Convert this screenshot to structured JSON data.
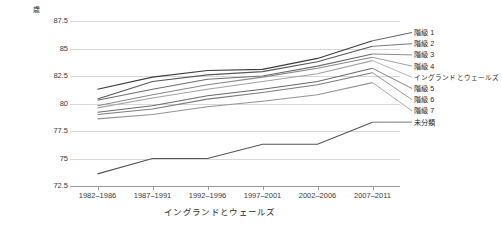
{
  "chart_data": {
    "type": "line",
    "title": "",
    "xlabel": "イングランドとウェールズ",
    "ylabel": "歳",
    "y_unit": "歳",
    "categories": [
      "1982–1986",
      "1987–1991",
      "1992–1996",
      "1997–2001",
      "2002–2006",
      "2007–2011"
    ],
    "ylim": [
      72.5,
      87.5
    ],
    "yticks": [
      "72.5",
      "75",
      "77.5",
      "80",
      "82.5",
      "85",
      "87.5"
    ],
    "grid": true,
    "legend_position": "right",
    "series": [
      {
        "name": "階級 1",
        "color": "#3c3c3c",
        "values": [
          81.3,
          82.4,
          83.0,
          83.1,
          84.1,
          85.7
        ]
      },
      {
        "name": "階級 2",
        "color": "#585858",
        "values": [
          80.4,
          82.0,
          82.6,
          82.9,
          83.8,
          85.2
        ]
      },
      {
        "name": "階級 3",
        "color": "#6e6e6e",
        "values": [
          80.3,
          81.3,
          82.2,
          82.5,
          83.4,
          84.5
        ]
      },
      {
        "name": "階級 4",
        "color": "#8a8a8a",
        "values": [
          79.8,
          80.8,
          81.7,
          82.4,
          83.2,
          84.2
        ]
      },
      {
        "name": "イングランドとウェールズ",
        "color": "#a3a3a3",
        "values": [
          79.6,
          80.5,
          81.3,
          82.0,
          82.7,
          83.9
        ]
      },
      {
        "name": "階級 5",
        "color": "#6a6a6a",
        "values": [
          79.2,
          79.8,
          80.7,
          81.3,
          82.0,
          83.2
        ]
      },
      {
        "name": "階級 6",
        "color": "#7d7d7d",
        "values": [
          79.0,
          79.5,
          80.4,
          81.0,
          81.7,
          82.8
        ]
      },
      {
        "name": "階級 7",
        "color": "#949494",
        "values": [
          78.6,
          79.0,
          79.7,
          80.2,
          80.8,
          81.9
        ]
      },
      {
        "name": "未分類",
        "color": "#555555",
        "values": [
          73.6,
          75.0,
          75.0,
          76.3,
          76.3,
          78.3
        ]
      }
    ]
  },
  "legend": {
    "items": [
      {
        "label": "階級 1"
      },
      {
        "label": "階級 2"
      },
      {
        "label": "階級 3"
      },
      {
        "label": "階級 4"
      },
      {
        "label": "イングランドとウェールズ"
      },
      {
        "label": "階級 5"
      },
      {
        "label": "階級 6"
      },
      {
        "label": "階級 7"
      },
      {
        "label": "未分類"
      }
    ]
  }
}
